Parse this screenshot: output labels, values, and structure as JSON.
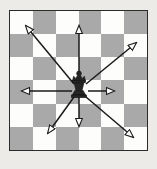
{
  "figure": {
    "background_color": "#edebe8"
  },
  "board": {
    "name": "chessboard",
    "columns": 6,
    "rows": 6,
    "light_square_color": "#fdfdfb",
    "dark_square_color": "#a9a9a9",
    "border_color": "#2b2b2b",
    "pattern": [
      [
        "light",
        "dark",
        "light",
        "dark",
        "light",
        "dark"
      ],
      [
        "dark",
        "light",
        "dark",
        "light",
        "dark",
        "light"
      ],
      [
        "light",
        "dark",
        "light",
        "dark",
        "light",
        "dark"
      ],
      [
        "dark",
        "light",
        "dark",
        "light",
        "dark",
        "light"
      ],
      [
        "light",
        "dark",
        "light",
        "dark",
        "light",
        "dark"
      ],
      [
        "dark",
        "light",
        "dark",
        "light",
        "dark",
        "light"
      ]
    ]
  },
  "piece": {
    "type": "queen",
    "color": "black",
    "column": 4,
    "row": 4,
    "fill": "#262626"
  },
  "arrows": {
    "stroke_color": "#1a1a1a",
    "head_style": "open-outline",
    "directions": [
      {
        "name": "up",
        "label": "N",
        "dx": 0,
        "dy": -1
      },
      {
        "name": "down",
        "label": "S",
        "dx": 0,
        "dy": 1
      },
      {
        "name": "left",
        "label": "W",
        "dx": -1,
        "dy": 0
      },
      {
        "name": "right",
        "label": "E",
        "dx": 1,
        "dy": 0
      },
      {
        "name": "up-left",
        "label": "NW",
        "dx": -1,
        "dy": -1
      },
      {
        "name": "up-right",
        "label": "NE",
        "dx": 1,
        "dy": -1
      },
      {
        "name": "down-left",
        "label": "SW",
        "dx": -1,
        "dy": 1
      },
      {
        "name": "down-right",
        "label": "SE",
        "dx": 1,
        "dy": 1
      }
    ]
  },
  "chart_data": {
    "type": "diagram",
    "grid": {
      "cols": 6,
      "rows": 6
    },
    "piece_position": {
      "col": 4,
      "row": 4
    },
    "move_vectors": [
      {
        "dir": "up",
        "from": [
          4,
          4
        ],
        "to": [
          4,
          1
        ]
      },
      {
        "dir": "up-right",
        "from": [
          4,
          4
        ],
        "to": [
          6,
          2
        ]
      },
      {
        "dir": "right",
        "from": [
          4,
          4
        ],
        "to": [
          5,
          4
        ]
      },
      {
        "dir": "down-right",
        "from": [
          4,
          4
        ],
        "to": [
          6,
          6
        ]
      },
      {
        "dir": "down",
        "from": [
          4,
          4
        ],
        "to": [
          4,
          5
        ]
      },
      {
        "dir": "down-left",
        "from": [
          4,
          4
        ],
        "to": [
          2,
          6
        ]
      },
      {
        "dir": "left",
        "from": [
          4,
          4
        ],
        "to": [
          1,
          4
        ]
      },
      {
        "dir": "up-left",
        "from": [
          4,
          4
        ],
        "to": [
          1,
          1
        ]
      }
    ]
  }
}
